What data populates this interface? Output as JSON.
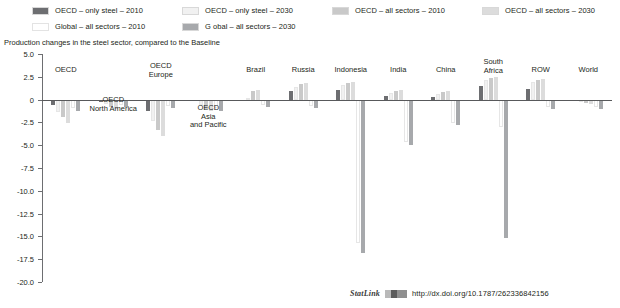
{
  "legend": {
    "rows": [
      [
        {
          "label": "OECD – only steel – 2010",
          "color": "#6d6e71"
        },
        {
          "label": "OECD – only steel – 2030",
          "color": "#f1f1f1"
        },
        {
          "label": "OECD – all sectors – 2010",
          "color": "#c9c9c9"
        },
        {
          "label": "OECD – all sectors – 2030",
          "color": "#dcdcdc"
        }
      ],
      [
        {
          "label": "Global – all sectors – 2010",
          "color": "#ffffff"
        },
        {
          "label": "G obal – all sectors – 2030",
          "color": "#a7a9ac"
        }
      ]
    ]
  },
  "subtitle": "Production changes in the steel sector, compared to the Baseline",
  "footer": {
    "statlink_word": "StatLink",
    "url": "http://dx.doi.org/10.1787/262336842156"
  },
  "chart_data": {
    "type": "bar",
    "title": "Production changes in the steel sector, compared to the Baseline",
    "xlabel": "",
    "ylabel": "",
    "ylim": [
      -20.0,
      5.0
    ],
    "yticks": [
      5.0,
      2.5,
      0,
      -2.5,
      -5.0,
      -7.5,
      -10.0,
      -12.5,
      -15.0,
      -17.5,
      -20.0
    ],
    "ytick_labels": [
      "5.0",
      "2.5",
      "0",
      "-2.5",
      "-5.0",
      "-7.5",
      "-10.0",
      "-12.5",
      "-15.0",
      "-17.5",
      "-20.0"
    ],
    "grid": false,
    "legend_position": "top",
    "categories": [
      "OECD",
      "OECD\nNorth America",
      "OECD\nEurope",
      "OECD\nAsia\nand Pacific",
      "Brazil",
      "Russia",
      "Indonesia",
      "India",
      "China",
      "South\nAfrica",
      "ROW",
      "World"
    ],
    "series": [
      {
        "name": "OECD – only steel – 2010",
        "color": "#6d6e71",
        "values": [
          -0.6,
          -0.3,
          -1.3,
          -0.2,
          -0.1,
          0.9,
          1.0,
          0.4,
          0.3,
          1.5,
          1.2,
          -0.2
        ]
      },
      {
        "name": "OECD – only steel – 2030",
        "color": "#f1f1f1",
        "values": [
          -1.4,
          -0.5,
          -2.4,
          -0.6,
          0.2,
          1.4,
          1.6,
          0.7,
          0.6,
          2.1,
          1.9,
          -0.3
        ]
      },
      {
        "name": "OECD – all sectors – 2010",
        "color": "#c9c9c9",
        "values": [
          -1.9,
          -0.8,
          -3.3,
          -1.0,
          0.9,
          1.7,
          1.8,
          0.9,
          0.8,
          2.4,
          2.2,
          -0.4
        ]
      },
      {
        "name": "OECD – all sectors – 2030",
        "color": "#dcdcdc",
        "values": [
          -2.6,
          -1.0,
          -4.0,
          -1.3,
          1.1,
          1.8,
          1.9,
          1.0,
          0.9,
          2.5,
          2.3,
          -0.5
        ]
      },
      {
        "name": "Global – all sectors – 2010",
        "color": "#ffffff",
        "values": [
          -0.9,
          -0.6,
          -0.7,
          -0.9,
          -0.6,
          -0.7,
          -15.7,
          -4.6,
          -2.6,
          -3.0,
          -0.8,
          -0.8
        ]
      },
      {
        "name": "G obal – all sectors – 2030",
        "color": "#a7a9ac",
        "values": [
          -1.2,
          -0.8,
          -0.9,
          -1.2,
          -0.8,
          -0.9,
          -16.8,
          -5.0,
          -2.8,
          -15.2,
          -1.0,
          -1.0
        ]
      }
    ]
  }
}
